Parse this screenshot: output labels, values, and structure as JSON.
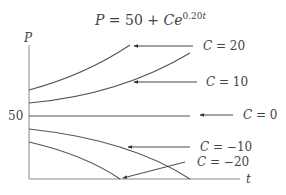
{
  "title": {
    "lhs": "P",
    "eq": " = 50 + ",
    "C": "C",
    "e": "e",
    "exp": "0.20",
    "exp_var": "t"
  },
  "axes": {
    "ylabel": "P",
    "xlabel": "t",
    "ytick": "50"
  },
  "curves": [
    {
      "C": 20,
      "label_C": "C",
      "label_rest": " = 20"
    },
    {
      "C": 10,
      "label_C": "C",
      "label_rest": " = 10"
    },
    {
      "C": 0,
      "label_C": "C",
      "label_rest": " = 0"
    },
    {
      "C": -10,
      "label_C": "C",
      "label_rest": " = −10"
    },
    {
      "C": -20,
      "label_C": "C",
      "label_rest": " = −20"
    }
  ],
  "colors": {
    "curve": "#555555",
    "axis": "#888888"
  }
}
